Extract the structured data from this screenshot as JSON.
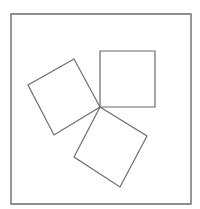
{
  "diagram": {
    "canvas": {
      "width": 200,
      "height": 209,
      "background": "#ffffff"
    },
    "stroke_color": "#6b6b6b",
    "frame": {
      "name": "outer-frame",
      "points": [
        [
          11,
          14
        ],
        [
          191,
          14
        ],
        [
          191,
          204
        ],
        [
          11,
          204
        ]
      ],
      "stroke_width": 1.4
    },
    "shapes": [
      {
        "name": "upright-square",
        "points": [
          [
            100,
            51
          ],
          [
            155,
            51
          ],
          [
            155,
            107
          ],
          [
            100,
            107
          ]
        ],
        "stroke_width": 1.2
      },
      {
        "name": "left-tilted-square",
        "points": [
          [
            100,
            107
          ],
          [
            74,
            59
          ],
          [
            28,
            85
          ],
          [
            54,
            135
          ]
        ],
        "stroke_width": 1.2
      },
      {
        "name": "bottom-tilted-square",
        "points": [
          [
            100,
            107
          ],
          [
            147,
            136
          ],
          [
            120,
            187
          ],
          [
            74,
            157
          ]
        ],
        "stroke_width": 1.2
      }
    ],
    "shared_vertex": [
      100,
      107
    ]
  }
}
